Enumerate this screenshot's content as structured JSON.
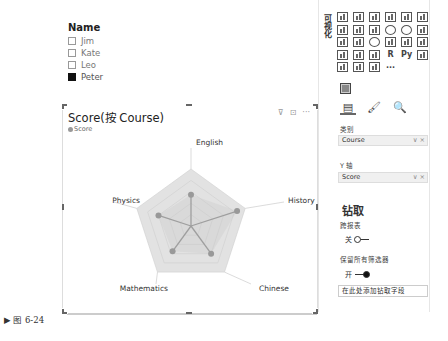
{
  "slicer": {
    "title": "Name",
    "items": [
      {
        "label": "Jim",
        "checked": false
      },
      {
        "label": "Kate",
        "checked": false
      },
      {
        "label": "Leo",
        "checked": false
      },
      {
        "label": "Peter",
        "checked": true
      }
    ]
  },
  "chart": {
    "title": "Score(按 Course)",
    "legend": "Score",
    "icons": [
      "filter-icon",
      "focus-mode-icon",
      "more-options-icon"
    ],
    "icon_glyphs": {
      "filter": "⊽",
      "focus": "⊡",
      "more": "···"
    }
  },
  "chart_data": {
    "type": "radar",
    "title": "Score(按 Course)",
    "categories": [
      "English",
      "History",
      "Chinese",
      "Mathematics",
      "Physics"
    ],
    "series": [
      {
        "name": "Score",
        "values": [
          55,
          85,
          60,
          55,
          60
        ]
      }
    ],
    "axis_max": 100,
    "grid_rings": 5,
    "legend_position": "top-left"
  },
  "panel": {
    "title": "可视化",
    "viz_more": "···",
    "viz_r_label": "R",
    "viz_py_label": "Py",
    "tabs": [
      "fields-tab",
      "format-tab",
      "analytics-tab"
    ],
    "tab_glyphs": [
      "▤",
      "🖌",
      "🔍"
    ],
    "category_label": "类别",
    "category_value": "Course",
    "y_axis_label": "Y 轴",
    "y_axis_value": "Score",
    "well_controls": "∨ ×",
    "drillthrough_title": "钻取",
    "cross_report_label": "跨报表",
    "cross_report_state": "关",
    "keep_filters_label": "保留所有筛选器",
    "keep_filters_state": "开",
    "drop_zone_text": "在此处添加钻取字段"
  },
  "caption": "▶ 图 6-24"
}
